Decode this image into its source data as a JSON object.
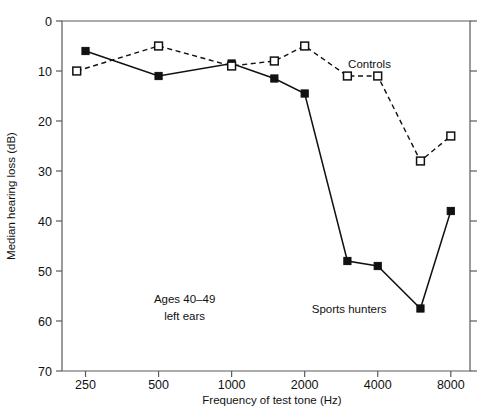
{
  "chart_data": {
    "type": "line",
    "title": "",
    "xlabel": "Frequency of test tone (Hz)",
    "ylabel": "Median hearing loss (dB)",
    "x_tick_labels": [
      "250",
      "500",
      "1000",
      "2000",
      "4000",
      "8000"
    ],
    "x_tick_values": [
      250,
      500,
      1000,
      2000,
      4000,
      8000
    ],
    "x_scale": "log2",
    "xlim": [
      200,
      9600
    ],
    "y_tick_labels": [
      "0",
      "10",
      "20",
      "30",
      "40",
      "50",
      "60",
      "70"
    ],
    "y_tick_values": [
      0,
      10,
      20,
      30,
      40,
      50,
      60,
      70
    ],
    "ylim": [
      0,
      70
    ],
    "y_inverted": true,
    "grid": false,
    "legend_position": "inline-annotations",
    "series": [
      {
        "name": "Sports hunters",
        "marker": "filled-square",
        "line": "solid",
        "points": [
          {
            "x": 250,
            "y": 6.0
          },
          {
            "x": 500,
            "y": 11.0
          },
          {
            "x": 1000,
            "y": 8.5
          },
          {
            "x": 1500,
            "y": 11.5
          },
          {
            "x": 2000,
            "y": 14.5
          },
          {
            "x": 3000,
            "y": 48.0
          },
          {
            "x": 4000,
            "y": 49.0
          },
          {
            "x": 6000,
            "y": 57.5
          },
          {
            "x": 8000,
            "y": 38.0
          }
        ]
      },
      {
        "name": "Controls",
        "marker": "open-square",
        "line": "dashed",
        "points": [
          {
            "x": 230,
            "y": 10.0
          },
          {
            "x": 500,
            "y": 5.0
          },
          {
            "x": 1000,
            "y": 9.0
          },
          {
            "x": 1500,
            "y": 8.0
          },
          {
            "x": 2000,
            "y": 5.0
          },
          {
            "x": 3000,
            "y": 11.0
          },
          {
            "x": 4000,
            "y": 11.0
          },
          {
            "x": 6000,
            "y": 28.0
          },
          {
            "x": 8000,
            "y": 23.0
          }
        ]
      }
    ],
    "annotations": [
      {
        "name": "controls-label",
        "text": "Controls",
        "x": 3700,
        "y": 8.5
      },
      {
        "name": "sports-hunters-label",
        "text": "Sports hunters",
        "x": 3050,
        "y": 57.5
      },
      {
        "name": "group-note-line1",
        "text": "Ages 40–49",
        "x": 640,
        "y": 55.5
      },
      {
        "name": "group-note-line2",
        "text": "left ears",
        "x": 640,
        "y": 59.0
      }
    ]
  }
}
